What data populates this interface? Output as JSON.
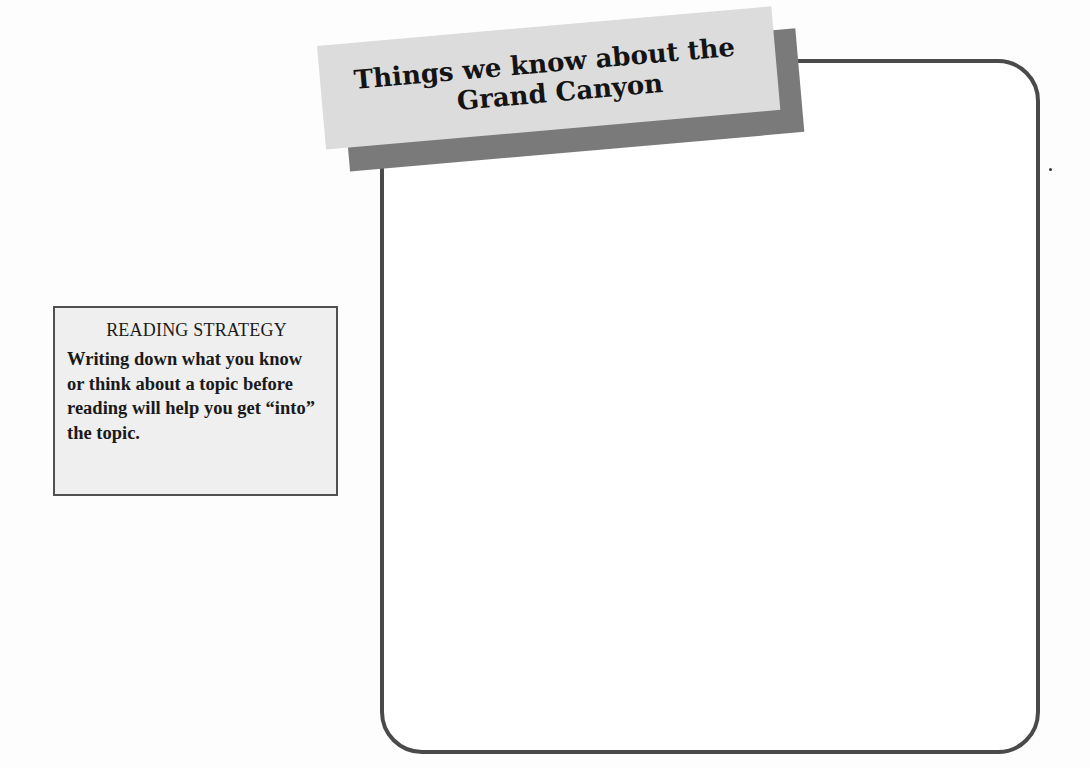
{
  "banner": {
    "title_line1": "Things we know about the",
    "title_line2": "Grand Canyon"
  },
  "write_box": {
    "content": ""
  },
  "sidebar": {
    "heading": "READING STRATEGY",
    "body": "Writing down what you know or think about a topic before reading will help you get “into” the topic."
  },
  "colors": {
    "box_border": "#4a4a4a",
    "banner_fill": "#dcdcdc",
    "banner_shadow": "#7a7a7a",
    "sidebar_fill": "#efefef",
    "sidebar_border": "#505050"
  }
}
